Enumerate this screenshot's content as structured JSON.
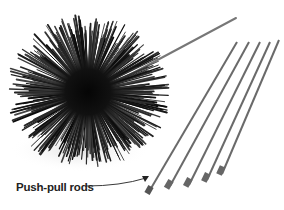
{
  "image": {
    "subject": "chimney brush with push-pull rods",
    "background_color": "#ffffff"
  },
  "annotations": [
    {
      "text": "Push-pull rods",
      "target": "rods",
      "arrow": true
    }
  ],
  "objects": {
    "brush": {
      "color": "#111111",
      "center": [
        88,
        92
      ],
      "radius": 78
    },
    "rods": {
      "count": 5,
      "color": "#6a6a6a"
    },
    "brush_handle": {
      "color": "#777777"
    }
  }
}
